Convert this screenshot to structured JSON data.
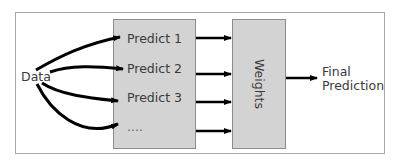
{
  "diagram": {
    "input": {
      "label": "Data"
    },
    "predictors": [
      {
        "label": "Predict 1"
      },
      {
        "label": "Predict 2"
      },
      {
        "label": "Predict 3"
      },
      {
        "label": "...."
      }
    ],
    "combiner": {
      "label": "Weights"
    },
    "output": {
      "line1": "Final",
      "line2": "Prediction"
    },
    "colors": {
      "box_fill": "#d3d3d3",
      "box_border": "#8c8c8c",
      "frame_border": "#a8a8a8",
      "arrow": "#000000",
      "text": "#3a3a3a"
    }
  }
}
